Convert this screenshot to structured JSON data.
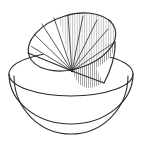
{
  "figure": {
    "title": "",
    "caption": "",
    "kind": "line-drawing",
    "background_color": "#ffffff",
    "stroke_color": "#2b2b2b",
    "hatch_color": "#8d8d8d",
    "fill_color": "#ffffff",
    "stroke_width": 1.1,
    "canvas": {
      "width": 143,
      "height": 152
    },
    "parts": {
      "sphere_outline": {
        "name": "sphere-outline",
        "center_x": 71,
        "center_y": 78,
        "radius_x": 62,
        "radius_y": 50
      },
      "equator_ellipse": {
        "name": "equator-ellipse",
        "center_x": 71,
        "center_y": 74,
        "radius_x": 62,
        "radius_y": 22
      },
      "bowl_inner_arc": {
        "name": "bowl-inner-rim-arc",
        "center_x": 71,
        "center_y": 74,
        "radius_x": 57,
        "radius_y": 58
      },
      "tilted_disc": {
        "name": "tilted-disc-ellipse",
        "center_x": 72,
        "center_y": 42,
        "radius_x": 45,
        "radius_y": 27,
        "rotation_deg": -17
      },
      "apex_vertex": {
        "name": "apex-vertex",
        "x": 72,
        "y": 71
      },
      "radial_line_count": 9,
      "hatched_sector_label": "shaded-sector"
    }
  }
}
